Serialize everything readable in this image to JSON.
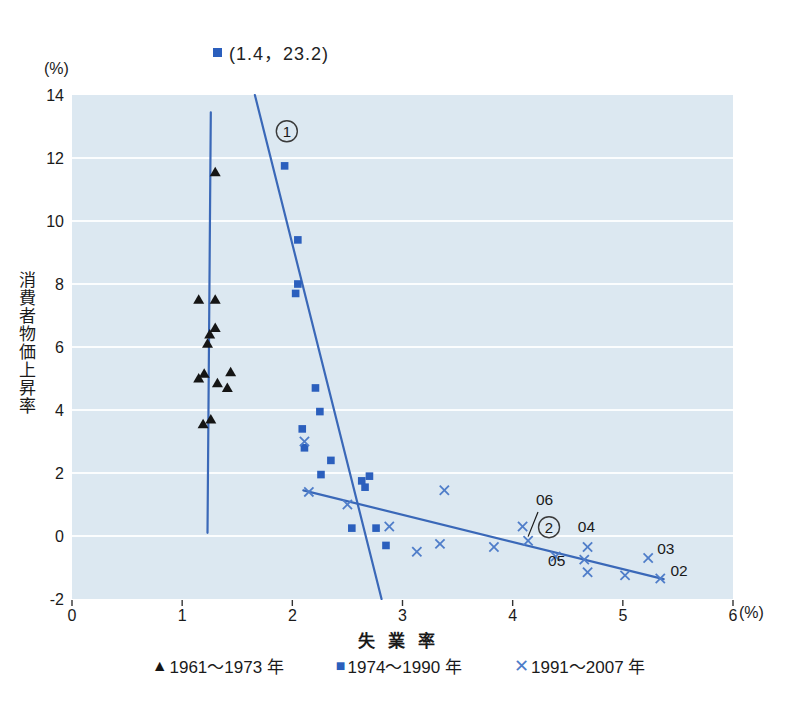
{
  "colors": {
    "plot_bg": "#dce8f1",
    "gridline": "#fbfdfe",
    "line_blue": "#3a68b8",
    "square_blue": "#2b5fbd",
    "x_blue": "#4f7dc9",
    "triangle_black": "#151515",
    "text": "#1a1a1a",
    "tick": "#333333",
    "annotation": "#1a1a1a",
    "circle_stroke": "#3a3a3a"
  },
  "chart_data": {
    "type": "scatter",
    "xlabel": "失 業 率",
    "ylabel": "消費者物価上昇率",
    "x_unit": "(%)",
    "y_unit": "(%)",
    "xlim": [
      0,
      6
    ],
    "ylim": [
      -2,
      14
    ],
    "x_ticks": [
      0,
      1,
      2,
      3,
      4,
      5,
      6
    ],
    "y_ticks": [
      14,
      12,
      10,
      8,
      6,
      4,
      2,
      0,
      -2
    ],
    "gridlines_y": [
      12,
      10,
      8,
      6,
      4,
      2,
      0
    ],
    "outlier_note": {
      "marker": "square",
      "text": "(1.4，23.2)"
    },
    "series": [
      {
        "name": "1961～1973 年",
        "marker": "triangle",
        "points": [
          [
            1.3,
            11.55
          ],
          [
            1.15,
            7.5
          ],
          [
            1.3,
            7.5
          ],
          [
            1.3,
            6.6
          ],
          [
            1.25,
            6.4
          ],
          [
            1.23,
            6.1
          ],
          [
            1.15,
            5.0
          ],
          [
            1.2,
            5.15
          ],
          [
            1.44,
            5.2
          ],
          [
            1.32,
            4.85
          ],
          [
            1.41,
            4.7
          ],
          [
            1.19,
            3.55
          ],
          [
            1.26,
            3.7
          ]
        ]
      },
      {
        "name": "1974～1990 年",
        "marker": "square",
        "points": [
          [
            1.93,
            11.75
          ],
          [
            2.05,
            9.4
          ],
          [
            2.05,
            8.0
          ],
          [
            2.03,
            7.7
          ],
          [
            2.21,
            4.7
          ],
          [
            2.25,
            3.95
          ],
          [
            2.09,
            3.4
          ],
          [
            2.11,
            2.8
          ],
          [
            2.35,
            2.4
          ],
          [
            2.26,
            1.95
          ],
          [
            2.7,
            1.9
          ],
          [
            2.63,
            1.75
          ],
          [
            2.66,
            1.55
          ],
          [
            2.54,
            0.25
          ],
          [
            2.76,
            0.25
          ],
          [
            2.85,
            -0.3
          ]
        ]
      },
      {
        "name": "1991～2007 年",
        "marker": "x",
        "points": [
          [
            2.11,
            3.0
          ],
          [
            2.15,
            1.4
          ],
          [
            2.5,
            1.0
          ],
          [
            2.88,
            0.3
          ],
          [
            3.13,
            -0.5
          ],
          [
            3.34,
            -0.25
          ],
          [
            3.38,
            1.45
          ],
          [
            3.83,
            -0.35
          ],
          [
            4.09,
            0.3
          ],
          [
            4.14,
            -0.15
          ],
          [
            4.39,
            -0.65
          ],
          [
            4.65,
            -0.75
          ],
          [
            4.68,
            -0.35
          ],
          [
            4.68,
            -1.15
          ],
          [
            5.02,
            -1.25
          ],
          [
            5.23,
            -0.7
          ],
          [
            5.34,
            -1.35
          ]
        ]
      }
    ],
    "lines": [
      {
        "id": "vertical-line-1961-1973",
        "from": [
          1.26,
          13.45
        ],
        "to": [
          1.23,
          0.1
        ],
        "label": ""
      },
      {
        "id": "curve-1",
        "from": [
          1.66,
          14.0
        ],
        "to": [
          2.81,
          -2.0
        ],
        "label": "1",
        "label_pos": [
          1.95,
          12.85
        ]
      },
      {
        "id": "curve-2",
        "from": [
          2.1,
          1.45
        ],
        "to": [
          5.37,
          -1.37
        ],
        "label": "2",
        "label_pos": [
          4.33,
          0.28
        ]
      }
    ],
    "annotations": [
      {
        "text": "06",
        "pos": [
          4.29,
          1.0
        ],
        "leader_from": [
          4.23,
          0.76
        ],
        "leader_to": [
          4.14,
          -0.02
        ]
      },
      {
        "text": "05",
        "pos": [
          4.4,
          -0.95
        ]
      },
      {
        "text": "04",
        "pos": [
          4.67,
          0.13
        ]
      },
      {
        "text": "03",
        "pos": [
          5.39,
          -0.57
        ]
      },
      {
        "text": "02",
        "pos": [
          5.51,
          -1.27
        ]
      }
    ]
  },
  "legend": {
    "triangle_glyph": "▲",
    "square_glyph": "■",
    "x_glyph": "✕"
  }
}
